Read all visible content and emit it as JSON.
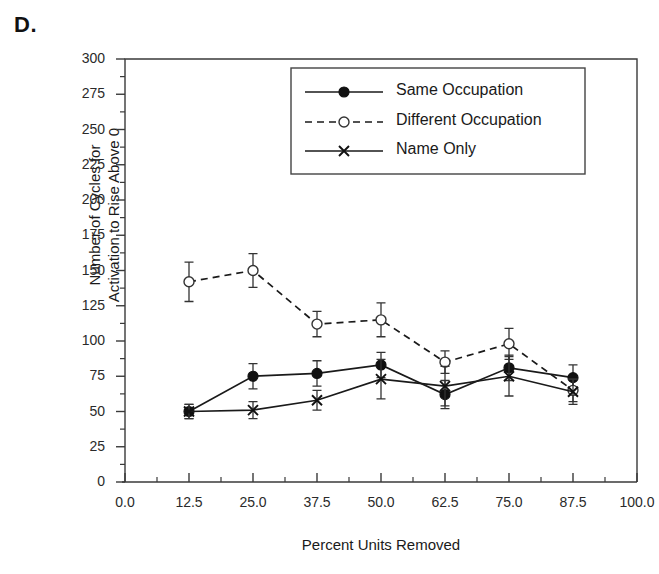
{
  "panel": {
    "label": "D."
  },
  "chart_data": {
    "type": "line",
    "title": "",
    "xlabel": "Percent Units Removed",
    "ylabel": "Number of Cycles for\nActivation to Rise Above 0",
    "ylabel_line1": "Number of Cycles for",
    "ylabel_line2": "Activation to Rise Above 0",
    "xlim": [
      0.0,
      100.0
    ],
    "ylim": [
      0,
      300
    ],
    "xticks": [
      0.0,
      12.5,
      25.0,
      37.5,
      50.0,
      62.5,
      75.0,
      87.5,
      100.0
    ],
    "xtick_labels": [
      "0.0",
      "12.5",
      "25.0",
      "37.5",
      "50.0",
      "62.5",
      "75.0",
      "87.5",
      "100.0"
    ],
    "yticks": [
      0,
      25,
      50,
      75,
      100,
      125,
      150,
      175,
      200,
      225,
      250,
      275,
      300
    ],
    "ytick_labels": [
      "0",
      "25",
      "50",
      "75",
      "100",
      "125",
      "150",
      "175",
      "200",
      "225",
      "250",
      "275",
      "300"
    ],
    "minor_tick_interval_x": 6.25,
    "minor_tick_interval_y": 12.5,
    "grid": false,
    "legend_position": "top-right",
    "x": [
      12.5,
      25.0,
      37.5,
      50.0,
      62.5,
      75.0,
      87.5
    ],
    "series": [
      {
        "name": "Same Occupation",
        "marker": "filled-circle",
        "line": "solid",
        "color": "#1a1a1a",
        "values": [
          50,
          75,
          77,
          83,
          62,
          81,
          74
        ],
        "errors": [
          5,
          9,
          9,
          9,
          10,
          9,
          9
        ]
      },
      {
        "name": "Different Occupation",
        "marker": "open-circle",
        "line": "dashed",
        "color": "#1a1a1a",
        "values": [
          142,
          150,
          112,
          115,
          85,
          98,
          65
        ],
        "errors": [
          14,
          12,
          9,
          12,
          8,
          11,
          8
        ]
      },
      {
        "name": "Name Only",
        "marker": "cross",
        "line": "solid",
        "color": "#1a1a1a",
        "values": [
          50,
          51,
          58,
          73,
          68,
          75,
          64
        ],
        "errors": [
          5,
          6,
          7,
          14,
          14,
          14,
          9
        ]
      }
    ]
  },
  "legend": {
    "entries": [
      {
        "label": "Same Occupation"
      },
      {
        "label": "Different Occupation"
      },
      {
        "label": "Name Only"
      }
    ]
  }
}
